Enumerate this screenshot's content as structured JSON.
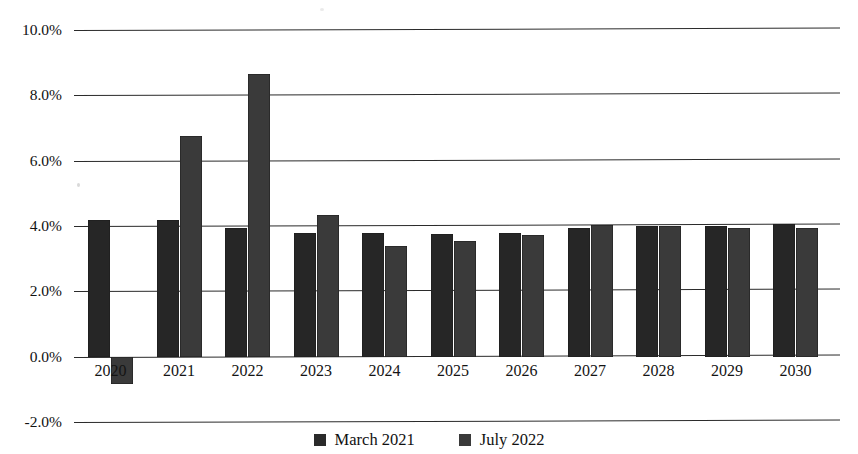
{
  "chart_data": {
    "type": "bar",
    "title": "",
    "xlabel": "",
    "ylabel": "",
    "grid": true,
    "legend_position": "bottom",
    "ylim": [
      -2.0,
      10.0
    ],
    "ytick_labels": [
      "10.0%",
      "8.0%",
      "6.0%",
      "4.0%",
      "2.0%",
      "0.0%",
      "-2.0%"
    ],
    "ytick_values": [
      10.0,
      8.0,
      6.0,
      4.0,
      2.0,
      0.0,
      -2.0
    ],
    "categories": [
      "2020",
      "2021",
      "2022",
      "2023",
      "2024",
      "2025",
      "2026",
      "2027",
      "2028",
      "2029",
      "2030"
    ],
    "series": [
      {
        "name": "March 2021",
        "color": "#262626",
        "values": [
          4.2,
          4.2,
          3.95,
          3.8,
          3.8,
          3.75,
          3.78,
          3.95,
          4.0,
          4.0,
          4.05
        ]
      },
      {
        "name": "July 2022",
        "color": "#3a3a3a",
        "values": [
          -0.85,
          6.75,
          8.65,
          4.35,
          3.4,
          3.55,
          3.72,
          4.02,
          4.0,
          3.95,
          3.95
        ]
      }
    ]
  },
  "legend": {
    "items": [
      {
        "label": "March 2021"
      },
      {
        "label": "July 2022"
      }
    ]
  },
  "axis": {
    "y_ticks": [
      "10.0%",
      "8.0%",
      "6.0%",
      "4.0%",
      "2.0%",
      "0.0%",
      "-2.0%"
    ],
    "x_ticks": [
      "2020",
      "2021",
      "2022",
      "2023",
      "2024",
      "2025",
      "2026",
      "2027",
      "2028",
      "2029",
      "2030"
    ]
  },
  "header": {
    "title": ""
  }
}
